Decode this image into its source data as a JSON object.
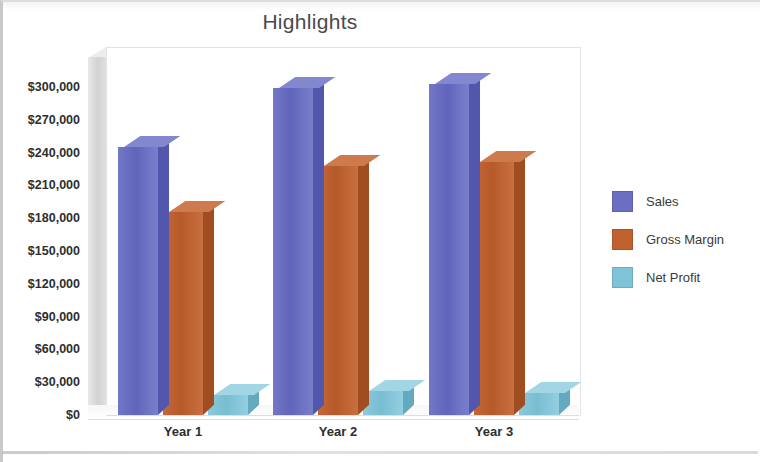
{
  "chart_data": {
    "type": "bar",
    "title": "Highlights",
    "xlabel": "",
    "ylabel": "",
    "categories": [
      "Year 1",
      "Year 2",
      "Year 3"
    ],
    "series": [
      {
        "name": "Sales",
        "color": "#6B6FC4",
        "values": [
          245000,
          299000,
          303000
        ]
      },
      {
        "name": "Gross Margin",
        "color": "#C0622F",
        "values": [
          186000,
          228000,
          231000
        ]
      },
      {
        "name": "Net Profit",
        "color": "#7EC3D8",
        "values": [
          18000,
          22000,
          20000
        ]
      }
    ],
    "ylim": [
      0,
      300000
    ],
    "ytick_values": [
      0,
      30000,
      60000,
      90000,
      120000,
      150000,
      180000,
      210000,
      240000,
      270000,
      300000
    ],
    "ytick_labels": [
      "$0",
      "$30,000",
      "$60,000",
      "$90,000",
      "$120,000",
      "$150,000",
      "$180,000",
      "$210,000",
      "$240,000",
      "$270,000",
      "$300,000"
    ],
    "grid": false,
    "legend_position": "right",
    "style_3d": true
  },
  "legend": {
    "items": [
      {
        "label": "Sales",
        "color": "#6B6FC4"
      },
      {
        "label": "Gross Margin",
        "color": "#C0622F"
      },
      {
        "label": "Net Profit",
        "color": "#7EC3D8"
      }
    ]
  }
}
